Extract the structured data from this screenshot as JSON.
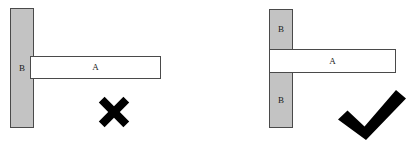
{
  "figure": {
    "background_color": "#ffffff",
    "fill_gray": "#c3c3c3",
    "outline_color": "#4a4a4a",
    "mark_color": "#000000"
  },
  "panels": [
    {
      "id": "incorrect",
      "verdict": "incorrect",
      "verdict_icon": "cross-mark-icon",
      "members": [
        {
          "id": "column",
          "label": "B",
          "style": "filled-gray",
          "orientation": "vertical",
          "continuous": true
        },
        {
          "id": "beam",
          "label": "A",
          "style": "outline-white",
          "orientation": "horizontal",
          "continuous": true
        }
      ]
    },
    {
      "id": "correct",
      "verdict": "correct",
      "verdict_icon": "check-mark-icon",
      "members": [
        {
          "id": "column-upper",
          "label": "B",
          "style": "filled-gray",
          "orientation": "vertical",
          "continuous": false
        },
        {
          "id": "column-lower",
          "label": "B",
          "style": "filled-gray",
          "orientation": "vertical",
          "continuous": false
        },
        {
          "id": "beam",
          "label": "A",
          "style": "outline-white",
          "orientation": "horizontal",
          "continuous": true
        }
      ]
    }
  ]
}
